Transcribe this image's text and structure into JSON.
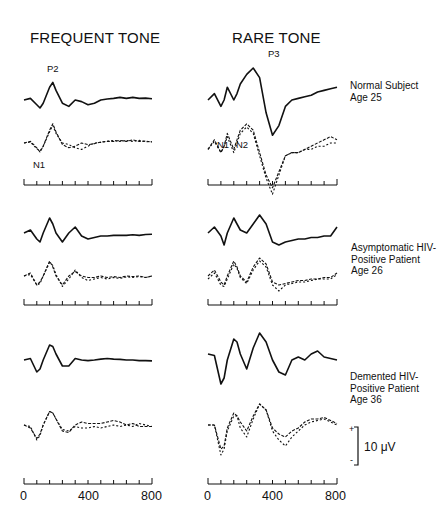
{
  "titles": {
    "left": "FREQUENT TONE",
    "right": "RARE TONE"
  },
  "rows": [
    {
      "label_lines": [
        "Normal Subject",
        "Age 25"
      ]
    },
    {
      "label_lines": [
        "Asymptomatic HIV-",
        "Positive Patient",
        "Age 26"
      ]
    },
    {
      "label_lines": [
        "Demented HIV-",
        "Positive Patient",
        "Age 36"
      ]
    }
  ],
  "peak_labels": {
    "p2": "P2",
    "n1_left": "N1",
    "p3": "P3",
    "n1_right": "N1",
    "n2": "N2"
  },
  "axis": {
    "tick_labels": [
      "0",
      "400",
      "800"
    ],
    "unit": "ms"
  },
  "scale_bar": {
    "label": "10 μV",
    "plus": "+",
    "minus": "-"
  },
  "chart_data": {
    "type": "line",
    "xlabel": "Time (ms)",
    "ylabel": "Amplitude (10 μV scale bar)",
    "xlim": [
      0,
      800
    ],
    "x_ticks": [
      0,
      80,
      160,
      240,
      320,
      400,
      480,
      560,
      640,
      720,
      800
    ],
    "grid": false,
    "legend": "none; rows labeled at right",
    "x": [
      0,
      40,
      80,
      100,
      120,
      160,
      180,
      200,
      240,
      280,
      320,
      360,
      400,
      440,
      480,
      520,
      560,
      600,
      640,
      680,
      720,
      760,
      800
    ],
    "panels": [
      {
        "row": "Normal Subject Age 25",
        "column": "Frequent Tone",
        "series": [
          {
            "name": "solid",
            "values": [
              0,
              0.5,
              -1.5,
              -2.5,
              -1,
              4,
              5.5,
              3,
              -1,
              -2,
              0,
              -0.5,
              -1.5,
              -1,
              0,
              0.3,
              0.5,
              0.8,
              0.5,
              0.8,
              0.5,
              0.6,
              0.4
            ]
          },
          {
            "name": "dashed-1",
            "values": [
              0,
              0.5,
              -1.5,
              -2.8,
              -1,
              4,
              6,
              3.5,
              -0.5,
              -1.5,
              -1,
              0,
              -0.5,
              -0.2,
              0.3,
              0.5,
              0.5,
              0.8,
              0.5,
              1,
              0.5,
              0.6,
              0.3
            ]
          },
          {
            "name": "dashed-2",
            "values": [
              0,
              0.3,
              -1.8,
              -2.5,
              -1,
              3.5,
              5.5,
              3,
              0,
              -0.5,
              -1.5,
              -2,
              -1,
              0,
              0.2,
              0.5,
              0.8,
              0.5,
              0.8,
              0.5,
              0.8,
              0.4,
              0.4
            ]
          }
        ]
      },
      {
        "row": "Normal Subject Age 25",
        "column": "Rare Tone",
        "series": [
          {
            "name": "solid",
            "values": [
              0,
              2,
              -2,
              0,
              4,
              0,
              2,
              5,
              8,
              10,
              7,
              -4,
              -11,
              -8,
              -2,
              0,
              0.5,
              1,
              1.5,
              2.5,
              3,
              3.5,
              4
            ]
          },
          {
            "name": "dashed-1",
            "values": [
              -2,
              1,
              -3,
              -1,
              3,
              -2,
              1,
              4,
              6,
              4,
              -3,
              -10,
              -14,
              -9,
              -4,
              -3,
              -3,
              -2,
              -1,
              0,
              1,
              2,
              1
            ]
          },
          {
            "name": "dashed-2",
            "values": [
              -2,
              0.5,
              -3,
              -1,
              2,
              -3,
              0,
              3,
              5,
              3,
              -4,
              -11,
              -16,
              -10,
              -4,
              -3,
              -3,
              -2,
              -2,
              -1,
              -1,
              0,
              0
            ]
          }
        ]
      },
      {
        "row": "Asymptomatic HIV-Positive Patient Age 26",
        "column": "Frequent Tone",
        "series": [
          {
            "name": "solid",
            "values": [
              0,
              1,
              -2,
              -3,
              0,
              5,
              3,
              0,
              -3,
              0,
              2,
              -1,
              -2,
              -1.5,
              -1,
              -1,
              -0.8,
              -0.8,
              -0.8,
              -0.6,
              -0.8,
              -0.5,
              -0.4
            ]
          },
          {
            "name": "dashed-1",
            "values": [
              0,
              1,
              -3,
              -2,
              0,
              5,
              3,
              0,
              -3,
              0,
              1.5,
              0,
              -0.5,
              -0.5,
              0,
              -0.5,
              -0.2,
              -0.5,
              0,
              -0.2,
              0,
              -0.5,
              0
            ]
          },
          {
            "name": "dashed-2",
            "values": [
              0,
              0.5,
              -3,
              -2.5,
              0,
              4.5,
              3.5,
              0.5,
              -3.5,
              -1,
              2,
              -0.5,
              -1.5,
              -1,
              -0.5,
              -1,
              -0.5,
              -0.8,
              -0.3,
              -0.5,
              -0.2,
              -0.5,
              0
            ]
          }
        ]
      },
      {
        "row": "Asymptomatic HIV-Positive Patient Age 26",
        "column": "Rare Tone",
        "series": [
          {
            "name": "solid",
            "values": [
              0,
              2,
              -1,
              -4,
              0,
              5,
              3,
              1,
              0,
              3,
              6,
              3,
              -3,
              -4,
              -3,
              -2.5,
              -2,
              -2,
              -1.5,
              -1.5,
              -1,
              -1,
              2
            ]
          },
          {
            "name": "dashed-1",
            "values": [
              0,
              2,
              -2,
              -3,
              0,
              5,
              3,
              0,
              -2,
              3,
              6,
              4,
              -2,
              -3,
              -2.5,
              -2,
              -1.5,
              -1.5,
              -1,
              -1,
              -0.5,
              -0.5,
              1
            ]
          },
          {
            "name": "dashed-2",
            "values": [
              -1,
              1,
              -3,
              -3.5,
              -1,
              4,
              2.5,
              -0.5,
              -2.5,
              2,
              5,
              3,
              -3,
              -5,
              -3,
              -2.5,
              -2,
              -2,
              -1.5,
              -1,
              -1,
              -1,
              0.5
            ]
          }
        ]
      },
      {
        "row": "Demented HIV-Positive Patient Age 36",
        "column": "Frequent Tone",
        "series": [
          {
            "name": "solid",
            "values": [
              0,
              0.5,
              -4,
              -3,
              0,
              5,
              4.5,
              2,
              -2,
              -2,
              0.5,
              0,
              -0.2,
              0,
              0.3,
              0.5,
              0.3,
              0.2,
              0,
              0,
              -0.2,
              -0.2,
              -0.3
            ]
          },
          {
            "name": "dashed-1",
            "values": [
              0,
              -1,
              -4.5,
              -3,
              0,
              4.5,
              4,
              2,
              -2,
              -2.5,
              0,
              1,
              0.5,
              0.5,
              0.5,
              1,
              1.5,
              1,
              0,
              0.5,
              -0.5,
              -0.5,
              -0.5
            ]
          },
          {
            "name": "dashed-2",
            "values": [
              0,
              -0.5,
              -5,
              -3.5,
              0,
              4.5,
              4,
              2,
              -1.5,
              -2,
              -0.5,
              -1,
              -1,
              -0.5,
              -1,
              -0.5,
              0,
              -0.5,
              0,
              -0.5,
              0.5,
              0,
              -0.5
            ]
          }
        ]
      },
      {
        "row": "Demented HIV-Positive Patient Age 36",
        "column": "Rare Tone",
        "series": [
          {
            "name": "solid",
            "values": [
              2,
              1.5,
              -8,
              -6,
              0,
              7,
              6,
              2,
              -3,
              4,
              9,
              6,
              0,
              -4,
              -5,
              0,
              1,
              0,
              2,
              3,
              1,
              0.5,
              0
            ]
          },
          {
            "name": "dashed-1",
            "values": [
              0,
              0,
              -8,
              -7,
              -1,
              4,
              3,
              1,
              -2,
              3,
              7,
              5,
              -1,
              -3,
              -4,
              -2,
              -1,
              1,
              2,
              2,
              2.5,
              1.5,
              0.5
            ]
          },
          {
            "name": "dashed-2",
            "values": [
              0,
              0,
              -10,
              -8,
              -2,
              3,
              3,
              -1,
              -4,
              2,
              7,
              5,
              -2,
              -5,
              -7,
              -4,
              -2,
              0,
              1,
              1.5,
              2,
              1,
              0
            ]
          }
        ]
      }
    ]
  }
}
